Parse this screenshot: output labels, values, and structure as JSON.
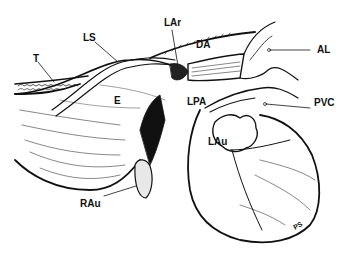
{
  "diagram": {
    "title": "",
    "background": "#ffffff",
    "ink": "#111111",
    "labels": {
      "T": "T",
      "LS": "LS",
      "LAr": "LAr",
      "DA": "DA",
      "AL": "AL",
      "E": "E",
      "LPA": "LPA",
      "PVC": "PVC",
      "LAu": "LAu",
      "RAu": "RAu",
      "PS": "PS"
    },
    "structures": [
      {
        "id": "T",
        "description": "trachea"
      },
      {
        "id": "LS",
        "description": "ligament/strand crossing esophagus"
      },
      {
        "id": "LAr",
        "description": "left aortic arch"
      },
      {
        "id": "DA",
        "description": "ductus arteriosus"
      },
      {
        "id": "AL",
        "description": "pointer to upper right vessel"
      },
      {
        "id": "E",
        "description": "esophagus"
      },
      {
        "id": "LPA",
        "description": "left pulmonary artery"
      },
      {
        "id": "PVC",
        "description": "pointer to vein"
      },
      {
        "id": "LAu",
        "description": "left auricle"
      },
      {
        "id": "RAu",
        "description": "right auricle"
      },
      {
        "id": "PS",
        "description": "small rotated marking on ventricle"
      }
    ]
  }
}
